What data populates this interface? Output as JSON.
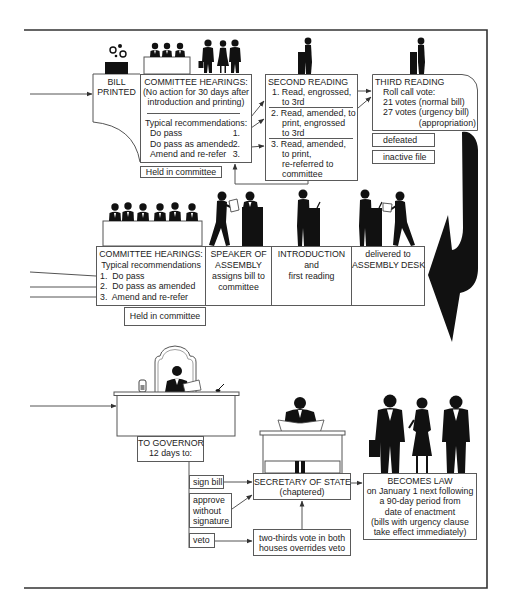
{
  "colors": {
    "frame": "#333333",
    "line": "#555555",
    "silhouette": "#111111",
    "text": "#222222",
    "background": "#ffffff"
  },
  "illustrations": [
    "printer-icon",
    "committee-panel-icon",
    "witnesses-icon",
    "podium-speaker-icon",
    "governor-desk-icon",
    "secretary-of-state-icon",
    "citizens-icon",
    "curved-flow-arrow-icon"
  ],
  "top_row": {
    "bill_printed": {
      "line1": "BILL",
      "line2": "PRINTED"
    },
    "committee_hearings": {
      "title": "COMMITTEE HEARINGS:",
      "note_line1": "(No action for 30 days after",
      "note_line2": "introduction and printing)",
      "recommendations_label": "Typical recommendations:",
      "recommendations": [
        {
          "label": "Do pass",
          "number": "1."
        },
        {
          "label": "Do pass as amended",
          "number": "2."
        },
        {
          "label": "Amend and re-refer",
          "number": "3."
        }
      ]
    },
    "held_in_committee": "Held in committee",
    "second_reading": {
      "title": "SECOND READING",
      "options": [
        {
          "lines": [
            "1. Read, engrossed,",
            "to 3rd"
          ]
        },
        {
          "lines": [
            "2. Read, amended, to",
            "print, engrossed",
            "to 3rd"
          ]
        },
        {
          "lines": [
            "3. Read, amended,",
            "to print,",
            "re-referred to",
            "committee"
          ]
        }
      ]
    },
    "third_reading": {
      "title": "THIRD READING",
      "lines": [
        "Roll call vote:",
        "21 votes (normal bill)",
        "27 votes (urgency bill)",
        "(appropriation)"
      ]
    },
    "outcomes": [
      "defeated",
      "inactive file"
    ]
  },
  "middle_row": {
    "committee_hearings": {
      "title": "COMMITTEE HEARINGS:",
      "subtitle": "Typical recommendations",
      "items": [
        "1.  Do pass",
        "2.  Do pass as amended",
        "3.  Amend and re-refer"
      ]
    },
    "held_in_committee": "Held in committee",
    "speaker": {
      "lines": [
        "SPEAKER OF",
        "ASSEMBLY",
        "assigns bill to",
        "committee"
      ]
    },
    "introduction": {
      "lines": [
        "INTRODUCTION",
        "and",
        "first reading"
      ]
    },
    "delivered": {
      "lines": [
        "delivered to",
        "ASSEMBLY DESK"
      ]
    }
  },
  "bottom_row": {
    "governor": {
      "title": "TO GOVERNOR",
      "subtitle": "12 days to:"
    },
    "governor_actions": [
      {
        "lines": [
          "sign bill"
        ]
      },
      {
        "lines": [
          "approve",
          "without",
          "signature"
        ]
      },
      {
        "lines": [
          "veto"
        ]
      }
    ],
    "secretary_of_state": {
      "title": "SECRETARY OF STATE",
      "subtitle": "(chaptered)"
    },
    "veto_override": {
      "lines": [
        "two-thirds vote in both",
        "houses overrides veto"
      ]
    },
    "becomes_law": {
      "title": "BECOMES LAW",
      "lines": [
        "on January 1 next following",
        "a 90-day period from",
        "date of enactment",
        "(bills with urgency clause",
        "take effect immediately)"
      ]
    }
  }
}
